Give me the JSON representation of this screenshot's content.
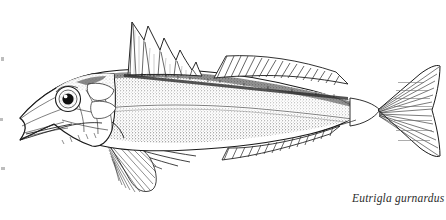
{
  "plate": {
    "kind": "scientific-illustration",
    "subject": "grey gurnard fish, lateral view facing left",
    "technique": "pen-and-ink line drawing with stipple shading",
    "background_color": "#ffffff",
    "ink_color": "#1a1a1a",
    "stipple_color": "#4a4a4a",
    "caption": "Eutrigla gurnardus",
    "caption_style": "italic serif",
    "caption_position": "bottom-right",
    "parts": [
      {
        "name": "head",
        "detail": "pointed snout, angled jaw, bony cheek plates, preopercular spine"
      },
      {
        "name": "eye",
        "detail": "large round eye, black pupil with white highlight, ringed iris"
      },
      {
        "name": "first-dorsal-fin",
        "detail": "tall spiny fin with scalloped membrane between sharp spines"
      },
      {
        "name": "second-dorsal-fin",
        "detail": "long low fin with parallel diagonal rays"
      },
      {
        "name": "pectoral-fin",
        "detail": "large fan-shaped fin with radiating rays"
      },
      {
        "name": "free-pectoral-rays",
        "detail": "three long finger-like feeler rays below pectoral fin"
      },
      {
        "name": "pelvic-fin",
        "detail": "downward-pointing fin with fine radiating rays"
      },
      {
        "name": "anal-fin",
        "detail": "long low fin mirroring second dorsal, parallel rays"
      },
      {
        "name": "caudal-fin",
        "detail": "forked tail with radiating rays"
      },
      {
        "name": "lateral-line",
        "detail": "line running along mid-body from gill to tail"
      },
      {
        "name": "body",
        "detail": "dense stipple on upper body fading to white belly"
      },
      {
        "name": "dorsal-scute-row",
        "detail": "row of small spiny scutes along dorsal fin base"
      }
    ]
  }
}
